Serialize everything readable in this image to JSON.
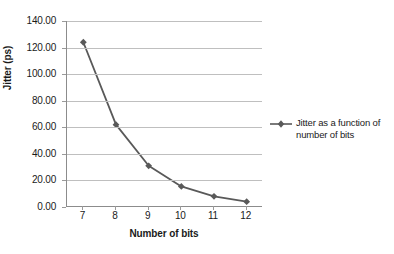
{
  "chart_data": {
    "type": "line",
    "title": "",
    "subtitle": "",
    "xlabel": "Number of bits",
    "ylabel": "Jitter (ps)",
    "categories": [
      "7",
      "8",
      "9",
      "10",
      "11",
      "12"
    ],
    "x": [
      7,
      8,
      9,
      10,
      11,
      12
    ],
    "series": [
      {
        "name": "Jitter as a function of number of bits",
        "values": [
          124.0,
          62.0,
          31.0,
          15.5,
          8.0,
          4.0
        ]
      }
    ],
    "values": [
      124.0,
      62.0,
      31.0,
      15.5,
      8.0,
      4.0
    ],
    "ylim": [
      0.0,
      140.0
    ],
    "ytick_step": 20.0,
    "ytick_labels": [
      "140.00",
      "120.00",
      "100.00",
      "80.00",
      "60.00",
      "40.00",
      "20.00",
      "0.00"
    ],
    "ytick_values": [
      140,
      120,
      100,
      80,
      60,
      40,
      20,
      0
    ],
    "xtick_labels": [
      "7",
      "8",
      "9",
      "10",
      "11",
      "12"
    ],
    "grid": true,
    "grid_axis": "y",
    "legend_position": "right",
    "legend_entries": [
      "Jitter as a function of number of bits"
    ],
    "marker": "diamond",
    "colors": {
      "series": "#595959",
      "gridline": "#bfbfbf",
      "axis": "#8c8c8c",
      "text": "#1a1a1a",
      "background": "#ffffff"
    }
  },
  "legend": {
    "entry_label": "Jitter as a function of number of bits"
  }
}
